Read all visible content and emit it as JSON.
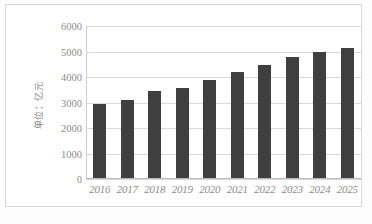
{
  "chart_data": {
    "type": "bar",
    "title": "",
    "subtitle": "",
    "xlabel": "",
    "ylabel": "单位：亿元",
    "categories": [
      "2016",
      "2017",
      "2018",
      "2019",
      "2020",
      "2021",
      "2022",
      "2023",
      "2024",
      "2025"
    ],
    "values": [
      2950,
      3100,
      3450,
      3570,
      3900,
      4180,
      4480,
      4780,
      4990,
      5150
    ],
    "series": [
      {
        "name": "",
        "values": [
          2950,
          3100,
          3450,
          3570,
          3900,
          4180,
          4480,
          4780,
          4990,
          5150
        ]
      }
    ],
    "ylim": [
      0,
      6000
    ],
    "y_ticks": [
      0,
      1000,
      2000,
      3000,
      4000,
      5000,
      6000
    ],
    "y_tick_labels": [
      "0",
      "1000",
      "2000",
      "3000",
      "4000",
      "5000",
      "6000"
    ],
    "grid": true,
    "legend": false,
    "legend_position": "none",
    "bar_color": "#3f3f3f",
    "gridline_color": "#d9d9d9",
    "axis_label_color": "#8d8d8d",
    "plot_background": "#ffffff",
    "frame_border_color": "#d8d8d8"
  }
}
